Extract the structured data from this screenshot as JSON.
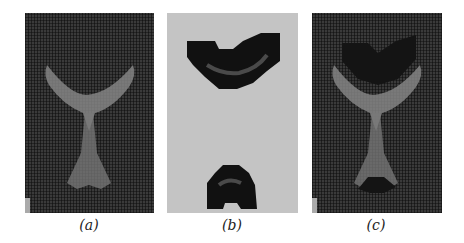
{
  "figure": {
    "panels": [
      {
        "id": "a",
        "caption": "(a)",
        "description": "DTI glyph field overlay on brain slice"
      },
      {
        "id": "b",
        "caption": "(b)",
        "description": "Segmentation mask with two dark regions on gray background"
      },
      {
        "id": "c",
        "caption": "(c)",
        "description": "DTI glyph field with segmented regions darkened"
      }
    ],
    "colors": {
      "background": "#ffffff",
      "mask_bg": "#c4c4c4",
      "mask_region": "#111111",
      "mask_inner": "#4a4a4a",
      "tissue_light": "#8a8a8a"
    }
  }
}
